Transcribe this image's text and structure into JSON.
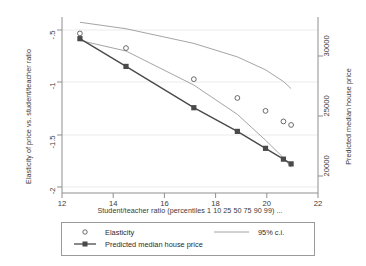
{
  "chart_data": {
    "type": "line",
    "title": "",
    "xlabel": "Student/teacher ratio (percentiles 1 10 25 50 75 90 99) ...",
    "ylabel": "Elasticity of price vs. student/teacher ratio",
    "ylabel_right": "Predicted median house price",
    "xlim": [
      12,
      22
    ],
    "ylim": [
      -2,
      -0.5
    ],
    "ylim_right": [
      18500,
      31500
    ],
    "xticks": [
      "12",
      "14",
      "16",
      "18",
      "20",
      "22"
    ],
    "xtick_values": [
      12,
      14,
      16,
      18,
      20,
      22
    ],
    "yticks": [
      "-.5",
      "-1",
      "-1.5",
      "-2"
    ],
    "ytick_values": [
      -0.5,
      -1,
      -1.5,
      -2
    ],
    "yticks_right": [
      "30000",
      "25000",
      "20000"
    ],
    "ytick_right_values": [
      30000,
      25000,
      20000
    ],
    "grid": true,
    "legend_position": "below-plot",
    "x": [
      12.7,
      14.5,
      17.15,
      18.85,
      19.95,
      20.65,
      20.95
    ],
    "percentiles": [
      1,
      10,
      25,
      50,
      75,
      90,
      99
    ],
    "series": [
      {
        "name": "Elasticity",
        "marker": "hollow-circle",
        "axis": "left",
        "values": [
          -0.64,
          -0.765,
          -1.03,
          -1.19,
          -1.3,
          -1.39,
          -1.42
        ]
      },
      {
        "name": "Predicted median house price",
        "marker": "filled-square-line",
        "axis": "right",
        "values": [
          29900,
          27850,
          24800,
          23050,
          21800,
          21000,
          20650
        ],
        "values_left_scale": [
          -1.0,
          -1.22,
          -1.55,
          -1.74,
          -1.87,
          -1.96,
          -2.0
        ]
      },
      {
        "name": "95% c.i.",
        "marker": "line",
        "axis": "left",
        "upper": [
          -0.545,
          -0.6,
          -0.725,
          -0.84,
          -0.95,
          -1.05,
          -1.11
        ],
        "lower": [
          -0.7,
          -0.79,
          -1.08,
          -1.33,
          -1.55,
          -1.7,
          -1.78
        ]
      }
    ]
  },
  "legend": {
    "elasticity_label": "Elasticity",
    "price_label": "Predicted median house price",
    "ci_label": "95% c.i."
  }
}
